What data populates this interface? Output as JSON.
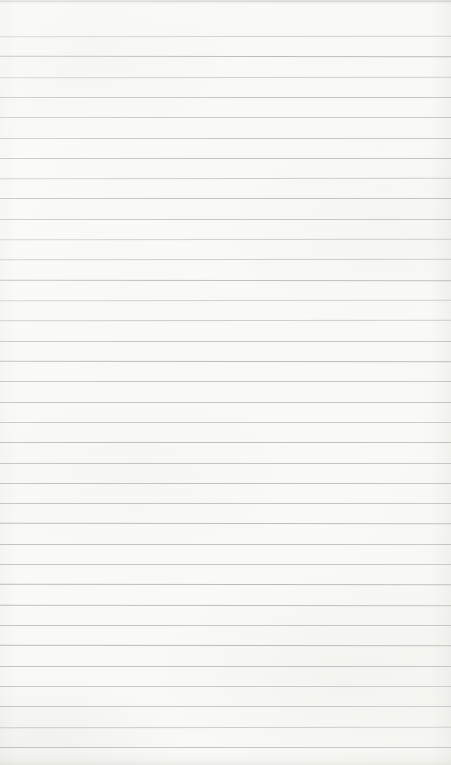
{
  "page": {
    "kind": "blank-ruled-notebook-paper-photo",
    "text_content": "",
    "width_px": 451,
    "height_px": 765,
    "paper_color": "#f9f9f6",
    "rule_color": "#aeafac",
    "rule_count": 36,
    "first_rule_y_px": 36,
    "rule_spacing_px": 20.31,
    "rule_thickness_px": 1,
    "partial_top_rule_y_px": 1,
    "bottom_margin_px": 18
  }
}
